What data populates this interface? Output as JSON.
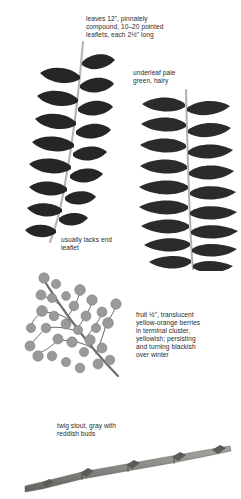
{
  "plate": {
    "title": "Botanical identification plate",
    "subject": "compound leaf, berries and twig",
    "background_color": "#ffffff",
    "text_color": "#2b2b2b"
  },
  "captions": {
    "leaves": "leaves 12\", pinnately\ncompound, 10–20 pointed\nleaflets, each 2½\" long",
    "underleaf": "underleaf pale\ngreen, hairy",
    "no_end_leaflet": "usually lacks end\nleaflet",
    "fruit": "fruit ½\", translucent\nyellow-orange berries\nin terminal cluster,\nyellowish; persisting\nand turning blackish\nover winter",
    "twig": "twig stout, gray with\nreddish buds"
  },
  "figures": {
    "leaf_left": {
      "name": "pinnately compound leaf, upper surface",
      "leaflet_color": "#262626",
      "rachis_color": "#b9b4aa",
      "leaflet_pairs": 8
    },
    "leaf_right": {
      "name": "pinnately compound leaf, underleaf surface",
      "leaflet_color": "#2b2b2b",
      "rachis_color": "#b5b0a6",
      "leaflet_pairs": 9
    },
    "berries": {
      "name": "terminal berry cluster",
      "berry_color": "#9a9a9a",
      "stem_color": "#6f6f6f",
      "berry_count": 31
    },
    "twig": {
      "name": "stout gray twig with buds",
      "twig_color": "#8c8a86",
      "bud_color": "#5d5b57"
    }
  }
}
